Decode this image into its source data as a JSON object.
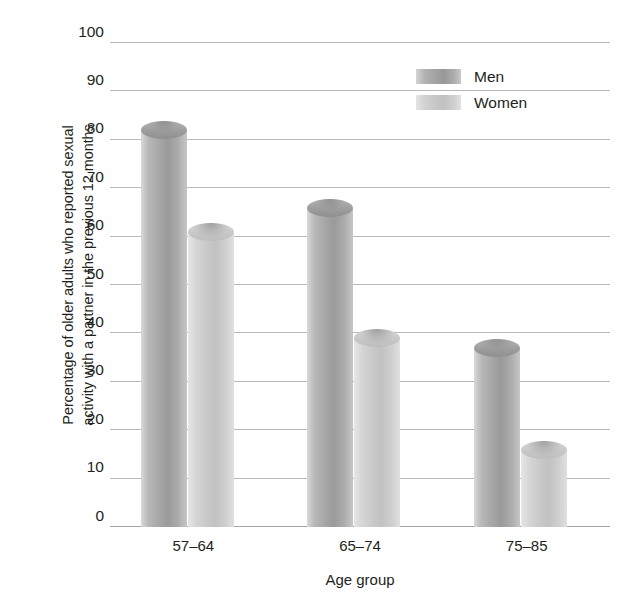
{
  "chart_data": {
    "type": "bar",
    "title": "",
    "categories": [
      "57–64",
      "65–74",
      "75–85"
    ],
    "series": [
      {
        "name": "Men",
        "values": [
          82,
          66,
          37
        ],
        "color": "#9e9e9e"
      },
      {
        "name": "Women",
        "values": [
          61,
          39,
          16
        ],
        "color": "#c9c9c9"
      }
    ],
    "xlabel": "Age group",
    "ylabel_lines": [
      "Percentage of older adults who reported sexual",
      "activity with a partner in the previous 12 months"
    ],
    "ylim": [
      0,
      100
    ],
    "ytick_step": 10,
    "yticks": [
      "100",
      "90",
      "80",
      "70",
      "60",
      "50",
      "40",
      "30",
      "20",
      "10",
      "0"
    ],
    "grid": true,
    "legend_position": "top-right",
    "gridline_color": "#b9b9b9",
    "text_color": "#231f20",
    "background": "#ffffff"
  },
  "legend": {
    "entries": [
      {
        "label": "Men"
      },
      {
        "label": "Women"
      }
    ]
  }
}
